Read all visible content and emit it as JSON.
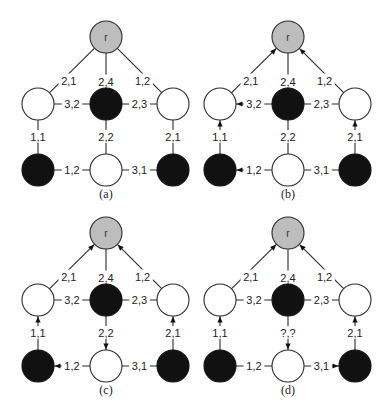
{
  "figure": {
    "root_label": "r",
    "colors": {
      "root": "#bdbdbd",
      "black": "#111111",
      "white": "#ffffff",
      "stroke": "#2a2a2a"
    },
    "node_colors": {
      "r": "gray",
      "ml": "white",
      "mm": "black",
      "mr": "white",
      "bl": "black",
      "bm": "white",
      "br": "black"
    },
    "panels": [
      {
        "id": "a",
        "caption": "(a)",
        "edge_labels": {
          "r_ml": "2,1",
          "r_mm": "2,4",
          "r_mr": "1,2",
          "ml_mm": "3,2",
          "mm_mr": "2,3",
          "ml_bl": "1,1",
          "mm_bm": "2,2",
          "mr_br": "2,1",
          "bl_bm": "1,2",
          "bm_br": "3,1"
        },
        "arrows": []
      },
      {
        "id": "b",
        "caption": "(b)",
        "edge_labels": {
          "r_ml": "2,1",
          "r_mm": "2,4",
          "r_mr": "1,2",
          "ml_mm": "3,2",
          "mm_mr": "2,3",
          "ml_bl": "1,1",
          "mm_bm": "2,2",
          "mr_br": "2,1",
          "bl_bm": "1,2",
          "bm_br": "3,1"
        },
        "arrows": [
          "ml->r",
          "mr->r",
          "mm->ml",
          "bl->ml",
          "br->mr",
          "bm->bl"
        ]
      },
      {
        "id": "c",
        "caption": "(c)",
        "edge_labels": {
          "r_ml": "2,1",
          "r_mm": "2,4",
          "r_mr": "1,2",
          "ml_mm": "3,2",
          "mm_mr": "2,3",
          "ml_bl": "1,1",
          "mm_bm": "2,2",
          "mr_br": "2,1",
          "bl_bm": "1,2",
          "bm_br": "3,1"
        },
        "arrows": [
          "ml->r",
          "mr->r",
          "bl->ml",
          "br->mr",
          "mm->bm",
          "bm->bl"
        ]
      },
      {
        "id": "d",
        "caption": "(d)",
        "edge_labels": {
          "r_ml": "2,1",
          "r_mm": "2,4",
          "r_mr": "1,2",
          "ml_mm": "3,2",
          "mm_mr": "2,3",
          "ml_bl": "1,1",
          "mm_bm": "?,?",
          "mr_br": "2,1",
          "bl_bm": "1,2",
          "bm_br": "3,1"
        },
        "arrows": [
          "ml->r",
          "mr->r",
          "bl->ml",
          "br->mr",
          "mm->bm",
          "bm->br"
        ]
      }
    ]
  }
}
